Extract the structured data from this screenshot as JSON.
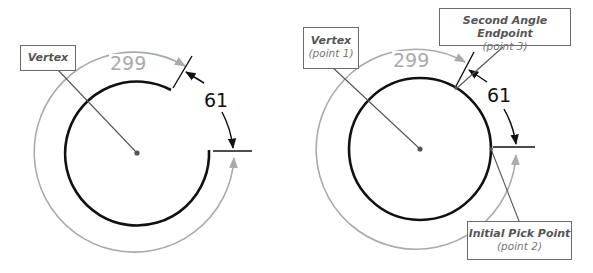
{
  "diagrams": [
    {
      "id": "left",
      "description": "Angle dimension measured on an arc",
      "labels": {
        "vertex": {
          "title": "Vertex"
        }
      },
      "dimensions": {
        "minor_angle": "61",
        "major_angle": "299"
      }
    },
    {
      "id": "right",
      "description": "Angle dimension measured on a full circle",
      "labels": {
        "vertex": {
          "title": "Vertex",
          "sub": "(point 1)"
        },
        "second_endpoint": {
          "title": "Second Angle Endpoint",
          "sub": "(point 3)"
        },
        "initial_pick": {
          "title": "Initial Pick Point",
          "sub": "(point 2)"
        }
      },
      "dimensions": {
        "minor_angle": "61",
        "major_angle": "299"
      }
    }
  ],
  "colors": {
    "geometry": "#111111",
    "reference_dimension": "#aaaaaa",
    "leader": "#555555",
    "label_border": "#6b6b6b"
  }
}
